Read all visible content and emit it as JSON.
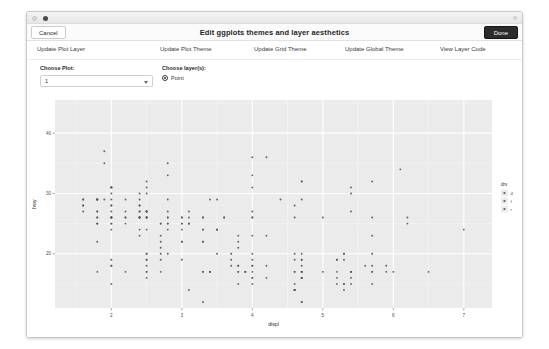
{
  "window": {
    "traffic_dots": [
      "minimize-dot",
      "active-dot",
      "resize-dot"
    ]
  },
  "header": {
    "title": "Edit ggplots themes and layer aesthetics",
    "cancel_label": "Cancel",
    "done_label": "Done"
  },
  "nav": {
    "items": [
      {
        "label": "Update Plot Layer",
        "x": 10
      },
      {
        "label": "Update Plot Theme",
        "x": 133
      },
      {
        "label": "Update Grid Theme",
        "x": 227
      },
      {
        "label": "Update Global Theme",
        "x": 318
      },
      {
        "label": "View Layer Code",
        "x": 413
      }
    ]
  },
  "controls": {
    "choose_plot_label": "Choose Plot:",
    "choose_plot_value": "1",
    "choose_plot_options": [
      "1"
    ],
    "choose_layers_label": "Choose layer(s):",
    "layers": [
      {
        "label": "Point",
        "checked": true
      }
    ]
  },
  "chart_data": {
    "type": "scatter",
    "title": "",
    "xlabel": "displ",
    "ylabel": "hwy",
    "xlim": [
      1.2,
      7.4
    ],
    "ylim": [
      11.0,
      45.5
    ],
    "xticks": [
      2,
      3,
      4,
      5,
      6,
      7
    ],
    "yticks": [
      20,
      30,
      40
    ],
    "grid": true,
    "panel_background": "#EBEBEB",
    "grid_major_color": "#FFFFFF",
    "grid_minor_color": "#F7F7F7",
    "point_color": "#595959",
    "legend": {
      "position": "right",
      "title": "drv",
      "entries": [
        {
          "label": "4",
          "marker": "circle"
        },
        {
          "label": "f",
          "marker": "circle"
        },
        {
          "label": "r",
          "marker": "circle"
        }
      ]
    },
    "x": [
      1.8,
      1.8,
      2.0,
      2.0,
      2.8,
      2.8,
      3.1,
      1.8,
      1.8,
      2.0,
      2.0,
      2.8,
      2.8,
      3.1,
      3.1,
      2.8,
      3.1,
      4.2,
      5.3,
      5.3,
      5.3,
      5.7,
      6.0,
      5.7,
      5.7,
      6.2,
      6.2,
      7.0,
      5.3,
      5.3,
      5.7,
      6.5,
      2.4,
      2.4,
      3.1,
      3.5,
      3.6,
      2.4,
      3.0,
      3.3,
      3.3,
      3.3,
      3.3,
      3.3,
      3.8,
      3.8,
      3.8,
      4.0,
      3.7,
      3.7,
      3.9,
      3.9,
      4.7,
      4.7,
      4.7,
      5.2,
      5.2,
      3.9,
      4.7,
      4.7,
      4.7,
      5.2,
      5.7,
      5.9,
      4.7,
      4.7,
      4.7,
      4.7,
      4.7,
      4.7,
      5.2,
      5.2,
      5.7,
      5.9,
      4.6,
      5.4,
      5.4,
      4.0,
      4.0,
      4.0,
      4.0,
      4.6,
      5.0,
      4.2,
      4.2,
      4.6,
      4.6,
      4.6,
      5.4,
      5.4,
      3.8,
      3.8,
      4.0,
      4.0,
      4.6,
      4.6,
      4.6,
      4.6,
      5.4,
      1.6,
      1.6,
      1.6,
      1.6,
      1.6,
      1.8,
      1.8,
      1.8,
      2.0,
      2.4,
      2.4,
      2.4,
      2.4,
      2.5,
      2.5,
      3.3,
      2.0,
      2.0,
      2.0,
      2.0,
      2.7,
      2.7,
      2.7,
      3.0,
      3.7,
      4.0,
      4.7,
      4.7,
      4.7,
      5.7,
      6.1,
      4.0,
      4.2,
      4.4,
      4.6,
      5.4,
      5.4,
      5.4,
      4.0,
      4.0,
      4.6,
      5.0,
      2.4,
      2.4,
      2.5,
      2.5,
      3.5,
      3.5,
      3.0,
      3.0,
      3.5,
      3.3,
      3.3,
      4.0,
      5.6,
      3.1,
      3.8,
      3.8,
      3.8,
      5.3,
      2.5,
      2.5,
      2.5,
      2.5,
      2.5,
      2.5,
      2.2,
      2.2,
      2.5,
      2.5,
      2.5,
      2.5,
      2.5,
      2.5,
      2.7,
      2.7,
      3.4,
      3.4,
      4.0,
      4.7,
      2.2,
      2.2,
      2.4,
      2.4,
      3.0,
      3.0,
      3.5,
      2.2,
      2.2,
      2.4,
      2.4,
      3.0,
      3.0,
      3.3,
      1.8,
      1.8,
      1.8,
      1.8,
      1.8,
      4.7,
      5.7,
      2.7,
      2.7,
      2.7,
      3.4,
      3.4,
      4.0,
      4.0,
      2.0,
      2.0,
      2.0,
      2.0,
      2.8,
      1.9,
      2.0,
      2.0,
      2.0,
      2.0,
      2.5,
      2.5,
      2.8,
      2.8,
      1.9,
      1.9,
      2.0,
      2.0,
      2.5,
      2.5,
      1.8,
      1.8,
      2.0,
      2.0,
      2.8,
      2.8,
      3.6
    ],
    "y": [
      29,
      29,
      31,
      30,
      26,
      26,
      27,
      26,
      25,
      28,
      27,
      25,
      25,
      25,
      25,
      24,
      25,
      23,
      20,
      15,
      20,
      17,
      17,
      26,
      23,
      26,
      25,
      24,
      19,
      14,
      15,
      17,
      27,
      30,
      26,
      29,
      26,
      24,
      24,
      22,
      22,
      24,
      24,
      17,
      22,
      21,
      23,
      23,
      19,
      18,
      17,
      17,
      19,
      19,
      12,
      17,
      15,
      17,
      17,
      12,
      17,
      16,
      18,
      18,
      16,
      16,
      16,
      16,
      17,
      17,
      19,
      19,
      17,
      17,
      20,
      17,
      16,
      17,
      18,
      15,
      16,
      14,
      17,
      18,
      16,
      17,
      19,
      17,
      17,
      17,
      17,
      17,
      18,
      16,
      15,
      14,
      14,
      14,
      15,
      27,
      28,
      29,
      29,
      28,
      29,
      29,
      29,
      29,
      26,
      26,
      26,
      26,
      26,
      26,
      26,
      25,
      25,
      26,
      24,
      21,
      22,
      23,
      22,
      20,
      33,
      32,
      32,
      29,
      32,
      34,
      36,
      36,
      29,
      26,
      27,
      30,
      31,
      26,
      26,
      28,
      26,
      29,
      28,
      27,
      24,
      24,
      24,
      22,
      19,
      20,
      17,
      12,
      19,
      18,
      14,
      15,
      18,
      18,
      15,
      17,
      16,
      18,
      17,
      19,
      19,
      17,
      29,
      27,
      31,
      32,
      27,
      26,
      26,
      25,
      25,
      17,
      17,
      20,
      18,
      26,
      26,
      27,
      28,
      25,
      25,
      24,
      27,
      25,
      26,
      23,
      26,
      26,
      26,
      26,
      25,
      27,
      25,
      27,
      20,
      20,
      19,
      17,
      20,
      17,
      29,
      27,
      31,
      31,
      26,
      26,
      28,
      27,
      29,
      31,
      31,
      26,
      26,
      27,
      30,
      33,
      35,
      37,
      35,
      15,
      18,
      20,
      20,
      22,
      17,
      19,
      18,
      20,
      29,
      26,
      29,
      29,
      24,
      44,
      29,
      26,
      29,
      29,
      29,
      29,
      23,
      24,
      44,
      41,
      29,
      26,
      28,
      29,
      29,
      29,
      28,
      29,
      26,
      26,
      26
    ],
    "n_points": 234
  }
}
